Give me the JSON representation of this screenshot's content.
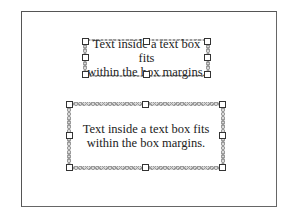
{
  "page": {
    "frame_color": "#555555",
    "background": "#ffffff"
  },
  "text_boxes": [
    {
      "id": "tight-text-box",
      "line1": "Text inside a text box fits",
      "line2": "within the box margins.",
      "selected": true
    },
    {
      "id": "wide-text-box",
      "line1": "Text inside a text box fits",
      "line2": "within the box margins.",
      "selected": true
    }
  ],
  "icons": {
    "resize-handle": "small white square"
  }
}
